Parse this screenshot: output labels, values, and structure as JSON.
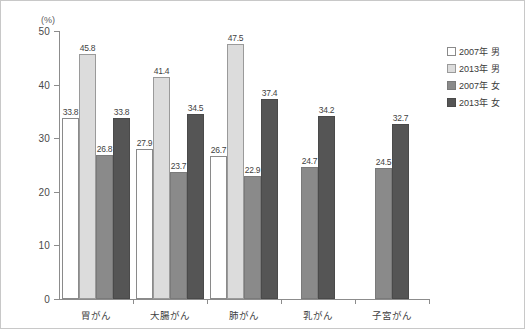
{
  "chart_data": {
    "type": "bar",
    "title": "",
    "subtitle": "",
    "xlabel": "",
    "ylabel": "(%)",
    "unit": "(%)",
    "ylim": [
      0,
      50
    ],
    "yticks": [
      0,
      10,
      20,
      30,
      40,
      50
    ],
    "ytick_labels": [
      "0",
      "10",
      "20",
      "30",
      "40",
      "50"
    ],
    "grid": false,
    "legend_position": "right",
    "categories": [
      "胃がん",
      "大腸がん",
      "肺がん",
      "乳がん",
      "子宮がん"
    ],
    "series": [
      {
        "name": "2007年 男",
        "color": "#ffffff",
        "values": [
          33.8,
          27.9,
          26.7,
          null,
          null
        ]
      },
      {
        "name": "2013年 男",
        "color": "#dcdcdc",
        "values": [
          45.8,
          41.4,
          47.5,
          null,
          null
        ]
      },
      {
        "name": "2007年 女",
        "color": "#8a8a8a",
        "values": [
          26.8,
          23.7,
          22.9,
          24.7,
          24.5
        ]
      },
      {
        "name": "2013年 女",
        "color": "#555555",
        "values": [
          33.8,
          34.5,
          37.4,
          34.2,
          32.7
        ]
      }
    ],
    "data_labels": [
      [
        "33.8",
        "45.8",
        "26.8",
        "33.8"
      ],
      [
        "27.9",
        "41.4",
        "23.7",
        "34.5"
      ],
      [
        "26.7",
        "47.5",
        "22.9",
        "37.4"
      ],
      [
        "24.7",
        "34.2"
      ],
      [
        "24.5",
        "32.7"
      ]
    ]
  },
  "legend": {
    "items": [
      {
        "label": "2007年 男",
        "swatch": "s0"
      },
      {
        "label": "2013年 男",
        "swatch": "s1"
      },
      {
        "label": "2007年 女",
        "swatch": "s2"
      },
      {
        "label": "2013年 女",
        "swatch": "s3"
      }
    ]
  },
  "axis": {
    "unit_label": "(%)",
    "y_labels": [
      "50",
      "40",
      "30",
      "20",
      "10",
      "0"
    ]
  }
}
